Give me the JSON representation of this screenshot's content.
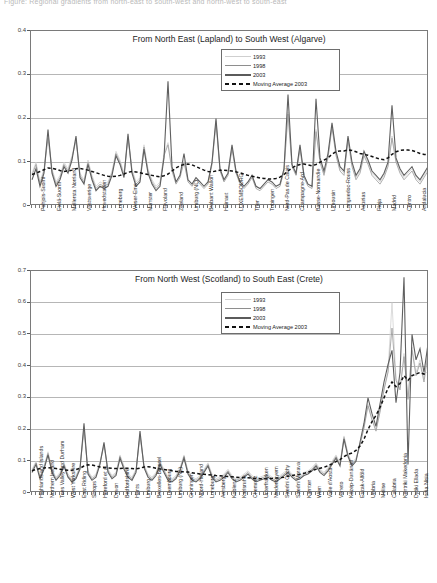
{
  "page": {
    "top_note": "Figure: Regional gradients from north-east to south-west and north-west to south-east"
  },
  "legend": {
    "items": [
      {
        "label": "1993",
        "style": "thin-light-line",
        "color": "#d2d2d2"
      },
      {
        "label": "1998",
        "style": "thin-grey-line",
        "color": "#9a9a9a"
      },
      {
        "label": "2003",
        "style": "thick-dark-line",
        "color": "#5f5f5f"
      },
      {
        "label": "Moving Average 2003",
        "style": "dashed-black-line",
        "color": "#111111"
      }
    ]
  },
  "chart_data": [
    {
      "type": "line",
      "id": "chart-top",
      "title": "From North East (Lapland) to South West (Algarve)",
      "xlabel": "",
      "ylabel": "",
      "ylim": [
        0,
        0.4
      ],
      "yticks": [
        "0",
        "0.1",
        "0.2",
        "0.3",
        "0.4"
      ],
      "grid": true,
      "legend_position": "top-right-inside",
      "categories": [
        "Pohjois-Suomi",
        "Etelä-Suomi",
        "Mellersta Norrland",
        "Vastsverige",
        "Hovedstaden",
        "Luneburg",
        "Weser-Ems",
        "Munster",
        "Flevoland",
        "Zeeland",
        "Limburg (NL)",
        "Brabant Wallon",
        "Hainaut",
        "LUXEMBOURG",
        "Trier",
        "Tubingen",
        "Nord-Pas de Calais",
        "Champagne-Ard",
        "Basse-Normandie",
        "Limousin",
        "Languedoc-Rouss",
        "Asturias",
        "Rioja",
        "Madrid",
        "Centro",
        "Andalucia"
      ],
      "series": [
        {
          "name": "1993",
          "values": [
            0.075,
            0.1,
            0.055,
            0.085,
            0.165,
            0.085,
            0.055,
            0.07,
            0.1,
            0.085,
            0.115,
            0.155,
            0.075,
            0.06,
            0.105,
            0.07,
            0.045,
            0.055,
            0.05,
            0.055,
            0.08,
            0.125,
            0.105,
            0.075,
            0.16,
            0.085,
            0.055,
            0.065,
            0.14,
            0.085,
            0.06,
            0.045,
            0.055,
            0.12,
            0.145,
            0.085,
            0.055,
            0.07,
            0.105,
            0.06,
            0.05,
            0.065,
            0.055,
            0.045,
            0.055,
            0.1,
            0.195,
            0.085,
            0.06,
            0.075,
            0.135,
            0.08,
            0.055,
            0.045,
            0.055,
            0.07,
            0.045,
            0.04,
            0.05,
            0.06,
            0.055,
            0.045,
            0.05,
            0.085,
            0.215,
            0.095,
            0.075,
            0.135,
            0.07,
            0.05,
            0.045,
            0.175,
            0.105,
            0.075,
            0.115,
            0.185,
            0.12,
            0.085,
            0.075,
            0.155,
            0.095,
            0.065,
            0.08,
            0.12,
            0.1,
            0.075,
            0.065,
            0.055,
            0.07,
            0.095,
            0.16,
            0.105,
            0.08,
            0.065,
            0.075,
            0.085,
            0.065,
            0.055,
            0.07,
            0.085
          ]
        },
        {
          "name": "1998",
          "values": [
            0.07,
            0.095,
            0.05,
            0.08,
            0.155,
            0.08,
            0.05,
            0.065,
            0.095,
            0.08,
            0.11,
            0.15,
            0.07,
            0.055,
            0.1,
            0.065,
            0.04,
            0.05,
            0.045,
            0.05,
            0.075,
            0.12,
            0.1,
            0.07,
            0.155,
            0.08,
            0.05,
            0.06,
            0.135,
            0.08,
            0.055,
            0.04,
            0.05,
            0.115,
            0.14,
            0.08,
            0.05,
            0.065,
            0.1,
            0.055,
            0.045,
            0.06,
            0.05,
            0.04,
            0.05,
            0.095,
            0.19,
            0.08,
            0.055,
            0.07,
            0.13,
            0.075,
            0.05,
            0.04,
            0.05,
            0.065,
            0.04,
            0.035,
            0.045,
            0.055,
            0.05,
            0.04,
            0.045,
            0.08,
            0.21,
            0.09,
            0.07,
            0.13,
            0.065,
            0.045,
            0.04,
            0.17,
            0.1,
            0.07,
            0.11,
            0.18,
            0.115,
            0.08,
            0.07,
            0.15,
            0.09,
            0.06,
            0.075,
            0.115,
            0.095,
            0.07,
            0.06,
            0.05,
            0.065,
            0.09,
            0.155,
            0.1,
            0.075,
            0.06,
            0.07,
            0.08,
            0.06,
            0.05,
            0.065,
            0.08
          ]
        },
        {
          "name": "2003",
          "values": [
            0.06,
            0.085,
            0.045,
            0.075,
            0.175,
            0.075,
            0.045,
            0.06,
            0.09,
            0.075,
            0.105,
            0.16,
            0.065,
            0.05,
            0.095,
            0.06,
            0.035,
            0.045,
            0.04,
            0.045,
            0.07,
            0.115,
            0.095,
            0.065,
            0.165,
            0.075,
            0.045,
            0.055,
            0.13,
            0.075,
            0.05,
            0.035,
            0.045,
            0.11,
            0.285,
            0.09,
            0.055,
            0.07,
            0.12,
            0.06,
            0.05,
            0.065,
            0.055,
            0.045,
            0.055,
            0.1,
            0.2,
            0.085,
            0.06,
            0.075,
            0.14,
            0.08,
            0.055,
            0.045,
            0.055,
            0.07,
            0.045,
            0.04,
            0.05,
            0.06,
            0.055,
            0.045,
            0.05,
            0.085,
            0.255,
            0.095,
            0.075,
            0.14,
            0.07,
            0.05,
            0.045,
            0.245,
            0.11,
            0.08,
            0.12,
            0.19,
            0.125,
            0.09,
            0.08,
            0.16,
            0.1,
            0.07,
            0.085,
            0.125,
            0.105,
            0.08,
            0.07,
            0.06,
            0.075,
            0.1,
            0.23,
            0.11,
            0.085,
            0.07,
            0.08,
            0.09,
            0.07,
            0.06,
            0.075,
            0.09
          ]
        },
        {
          "name": "Moving Average 2003",
          "values": [
            0.072,
            0.075,
            0.079,
            0.083,
            0.087,
            0.086,
            0.084,
            0.081,
            0.079,
            0.08,
            0.082,
            0.085,
            0.086,
            0.084,
            0.082,
            0.079,
            0.076,
            0.073,
            0.07,
            0.068,
            0.067,
            0.068,
            0.07,
            0.073,
            0.077,
            0.079,
            0.078,
            0.076,
            0.074,
            0.072,
            0.07,
            0.068,
            0.067,
            0.069,
            0.073,
            0.08,
            0.087,
            0.092,
            0.095,
            0.096,
            0.094,
            0.09,
            0.086,
            0.082,
            0.079,
            0.078,
            0.08,
            0.082,
            0.082,
            0.081,
            0.08,
            0.078,
            0.076,
            0.073,
            0.07,
            0.068,
            0.066,
            0.064,
            0.063,
            0.062,
            0.062,
            0.063,
            0.066,
            0.072,
            0.08,
            0.087,
            0.092,
            0.095,
            0.096,
            0.094,
            0.092,
            0.095,
            0.1,
            0.105,
            0.11,
            0.118,
            0.124,
            0.126,
            0.126,
            0.128,
            0.127,
            0.124,
            0.12,
            0.118,
            0.116,
            0.113,
            0.11,
            0.107,
            0.106,
            0.11,
            0.118,
            0.124,
            0.127,
            0.128,
            0.128,
            0.127,
            0.124,
            0.12,
            0.118,
            0.118
          ]
        }
      ]
    },
    {
      "type": "line",
      "id": "chart-bottom",
      "title": "From North West (Scotland) to South East (Crete)",
      "xlabel": "",
      "ylabel": "",
      "ylim": [
        0,
        0.7
      ],
      "yticks": [
        "0",
        "0.1",
        "0.2",
        "0.3",
        "0.4",
        "0.5",
        "0.6",
        "0.7"
      ],
      "grid": true,
      "legend_position": "top-right-inside",
      "categories": [
        "Highlands and Islands",
        "Northern Ireland",
        "Tees Valley and Durham",
        "West Yorkshire",
        "East Riding",
        "Shrops",
        "Hereford et al.",
        "Devon",
        "Bedfordshire",
        "Hants",
        "Limburg",
        "Bruxelles-Brussel",
        "Luxembourg",
        "Limburg (NL)",
        "Groningen",
        "Noord-Holland",
        "Luneburg",
        "Arnsberg",
        "Koblenz",
        "Karlsruhe",
        "Chemnitz",
        "Unterfranken",
        "Niederbayern",
        "Stredni Cechy",
        "Stredni Morava",
        "Karnten",
        "Wien",
        "Valle d'Aosta",
        "Veneto",
        "Közép-Dunántúl",
        "Eszak-Alföld",
        "Umbria",
        "Molise",
        "Calabria",
        "Kentriki Makedonia",
        "Dytiki Ellada",
        "Ionia Nisia"
      ],
      "series": [
        {
          "name": "1993",
          "values": [
            0.075,
            0.1,
            0.055,
            0.085,
            0.13,
            0.075,
            0.05,
            0.065,
            0.095,
            0.06,
            0.045,
            0.055,
            0.085,
            0.21,
            0.07,
            0.05,
            0.06,
            0.1,
            0.155,
            0.075,
            0.055,
            0.065,
            0.12,
            0.085,
            0.06,
            0.05,
            0.075,
            0.185,
            0.09,
            0.06,
            0.05,
            0.065,
            0.1,
            0.075,
            0.05,
            0.045,
            0.055,
            0.08,
            0.12,
            0.07,
            0.05,
            0.045,
            0.055,
            0.075,
            0.095,
            0.06,
            0.045,
            0.05,
            0.06,
            0.075,
            0.055,
            0.045,
            0.05,
            0.06,
            0.07,
            0.055,
            0.045,
            0.05,
            0.055,
            0.06,
            0.05,
            0.045,
            0.055,
            0.065,
            0.075,
            0.06,
            0.05,
            0.055,
            0.065,
            0.07,
            0.08,
            0.095,
            0.075,
            0.065,
            0.08,
            0.1,
            0.12,
            0.095,
            0.18,
            0.125,
            0.095,
            0.11,
            0.155,
            0.21,
            0.28,
            0.235,
            0.2,
            0.26,
            0.33,
            0.385,
            0.6,
            0.36,
            0.33,
            0.44,
            0.3,
            0.46,
            0.38,
            0.42,
            0.36,
            0.45
          ]
        },
        {
          "name": "1998",
          "values": [
            0.07,
            0.095,
            0.05,
            0.08,
            0.125,
            0.07,
            0.045,
            0.06,
            0.09,
            0.055,
            0.04,
            0.05,
            0.08,
            0.2,
            0.065,
            0.045,
            0.055,
            0.095,
            0.15,
            0.07,
            0.05,
            0.06,
            0.115,
            0.08,
            0.055,
            0.045,
            0.07,
            0.18,
            0.085,
            0.055,
            0.045,
            0.06,
            0.095,
            0.07,
            0.045,
            0.04,
            0.05,
            0.075,
            0.115,
            0.065,
            0.045,
            0.04,
            0.05,
            0.07,
            0.09,
            0.055,
            0.04,
            0.045,
            0.055,
            0.07,
            0.05,
            0.04,
            0.045,
            0.055,
            0.065,
            0.05,
            0.04,
            0.045,
            0.05,
            0.055,
            0.045,
            0.04,
            0.05,
            0.06,
            0.07,
            0.055,
            0.045,
            0.05,
            0.06,
            0.065,
            0.075,
            0.09,
            0.07,
            0.06,
            0.075,
            0.095,
            0.115,
            0.09,
            0.175,
            0.12,
            0.09,
            0.105,
            0.15,
            0.205,
            0.275,
            0.23,
            0.195,
            0.255,
            0.325,
            0.38,
            0.52,
            0.355,
            0.325,
            0.43,
            0.295,
            0.45,
            0.37,
            0.41,
            0.35,
            0.44
          ]
        },
        {
          "name": "2003",
          "values": [
            0.065,
            0.09,
            0.045,
            0.075,
            0.12,
            0.065,
            0.04,
            0.055,
            0.085,
            0.05,
            0.035,
            0.045,
            0.075,
            0.22,
            0.06,
            0.04,
            0.05,
            0.09,
            0.16,
            0.065,
            0.045,
            0.055,
            0.11,
            0.075,
            0.05,
            0.04,
            0.065,
            0.195,
            0.08,
            0.05,
            0.04,
            0.055,
            0.09,
            0.065,
            0.04,
            0.035,
            0.045,
            0.07,
            0.11,
            0.06,
            0.04,
            0.035,
            0.045,
            0.065,
            0.085,
            0.05,
            0.035,
            0.04,
            0.05,
            0.065,
            0.045,
            0.035,
            0.04,
            0.05,
            0.06,
            0.045,
            0.035,
            0.04,
            0.045,
            0.05,
            0.04,
            0.035,
            0.045,
            0.055,
            0.065,
            0.05,
            0.04,
            0.045,
            0.055,
            0.06,
            0.07,
            0.085,
            0.065,
            0.055,
            0.07,
            0.09,
            0.11,
            0.085,
            0.17,
            0.115,
            0.085,
            0.1,
            0.16,
            0.22,
            0.3,
            0.25,
            0.21,
            0.28,
            0.35,
            0.405,
            0.45,
            0.285,
            0.38,
            0.68,
            0.09,
            0.5,
            0.42,
            0.455,
            0.38,
            0.47
          ]
        },
        {
          "name": "Moving Average 2003",
          "values": [
            0.07,
            0.074,
            0.077,
            0.079,
            0.08,
            0.079,
            0.077,
            0.075,
            0.073,
            0.072,
            0.072,
            0.074,
            0.078,
            0.085,
            0.089,
            0.088,
            0.085,
            0.082,
            0.08,
            0.079,
            0.078,
            0.077,
            0.077,
            0.078,
            0.078,
            0.077,
            0.076,
            0.078,
            0.082,
            0.083,
            0.081,
            0.078,
            0.076,
            0.074,
            0.072,
            0.07,
            0.068,
            0.067,
            0.067,
            0.066,
            0.064,
            0.062,
            0.06,
            0.059,
            0.058,
            0.057,
            0.055,
            0.054,
            0.053,
            0.052,
            0.051,
            0.05,
            0.049,
            0.049,
            0.048,
            0.047,
            0.046,
            0.045,
            0.045,
            0.045,
            0.046,
            0.047,
            0.048,
            0.05,
            0.053,
            0.055,
            0.057,
            0.059,
            0.062,
            0.066,
            0.07,
            0.075,
            0.078,
            0.081,
            0.086,
            0.092,
            0.099,
            0.105,
            0.115,
            0.122,
            0.126,
            0.134,
            0.148,
            0.17,
            0.2,
            0.225,
            0.245,
            0.27,
            0.3,
            0.33,
            0.35,
            0.335,
            0.345,
            0.37,
            0.355,
            0.37,
            0.375,
            0.38,
            0.375,
            0.38
          ]
        }
      ]
    }
  ]
}
